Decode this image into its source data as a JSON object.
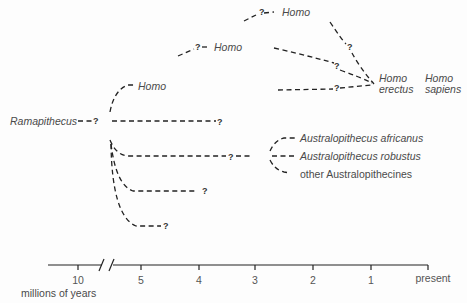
{
  "taxa": {
    "ramapithecus": "Ramapithecus",
    "homo_early": "Homo",
    "homo_mid": "Homo",
    "homo_top": "Homo",
    "homo_erectus_1": "Homo",
    "homo_erectus_2": "erectus",
    "homo_sapiens_1": "Homo",
    "homo_sapiens_2": "sapiens",
    "australopithecus_africanus": "Australopithecus africanus",
    "australopithecus_robustus": "Australopithecus robustus",
    "other_australopithecines": "other Australopithecines"
  },
  "uncertainty_mark": "?",
  "timeline": {
    "ticks": [
      "10",
      "5",
      "4",
      "3",
      "2",
      "1",
      "present"
    ],
    "unit_label": "millions of years",
    "break_symbol": "//"
  }
}
